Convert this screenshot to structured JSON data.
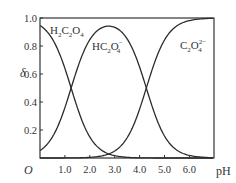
{
  "chart_data": {
    "type": "line",
    "title": "",
    "xlabel": "pH",
    "ylabel": "δ",
    "origin_label": "O",
    "xlim": [
      0,
      7.0
    ],
    "ylim": [
      0,
      1.0
    ],
    "grid": false,
    "legend": "inline labels",
    "x_ticks": [
      "1.0",
      "2.0",
      "3.0",
      "4.0",
      "5.0",
      "6.0"
    ],
    "y_ticks": [
      "0.2",
      "0.4",
      "0.6",
      "0.8",
      "1.0"
    ],
    "pKa1": 1.25,
    "pKa2": 4.27,
    "x": [
      0,
      0.5,
      1.0,
      1.25,
      1.5,
      2.0,
      2.5,
      2.76,
      3.0,
      3.5,
      4.0,
      4.27,
      4.5,
      5.0,
      5.5,
      6.0,
      6.5,
      7.0
    ],
    "series": [
      {
        "name": "H2C2O4",
        "label_main": "H",
        "label_parts": [
          "2",
          "C",
          "2",
          "O",
          "4"
        ],
        "values": [
          0.95,
          0.85,
          0.64,
          0.5,
          0.36,
          0.15,
          0.05,
          0.03,
          0.02,
          0.0,
          0.0,
          0.0,
          0.0,
          0.0,
          0.0,
          0.0,
          0.0,
          0.0
        ]
      },
      {
        "name": "HC2O4-",
        "values": [
          0.05,
          0.15,
          0.36,
          0.5,
          0.63,
          0.83,
          0.9,
          0.94,
          0.92,
          0.85,
          0.65,
          0.5,
          0.37,
          0.16,
          0.06,
          0.02,
          0.01,
          0.0
        ]
      },
      {
        "name": "C2O4^2-",
        "values": [
          0.0,
          0.0,
          0.0,
          0.0,
          0.0,
          0.02,
          0.05,
          0.03,
          0.06,
          0.15,
          0.35,
          0.5,
          0.63,
          0.84,
          0.94,
          0.98,
          0.99,
          1.0
        ]
      }
    ]
  },
  "labels": {
    "h2c2o4": {
      "a": "H",
      "s1": "2",
      "b": "C",
      "s2": "2",
      "c": "O",
      "s3": "4"
    },
    "hc2o4": {
      "a": "HC",
      "s1": "2",
      "b": "O",
      "sup": "−",
      "s2": "4"
    },
    "c2o4": {
      "a": "C",
      "s1": "2",
      "b": "O",
      "sup": "2−",
      "s2": "4"
    }
  }
}
